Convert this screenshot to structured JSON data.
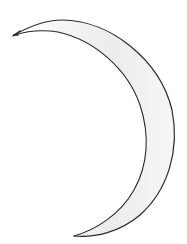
{
  "drawing": {
    "subject": "crescent moon sketch",
    "colors": {
      "background": "#ffffff",
      "stroke": "#2a2a2a",
      "shading": "#e6e6e6"
    }
  }
}
